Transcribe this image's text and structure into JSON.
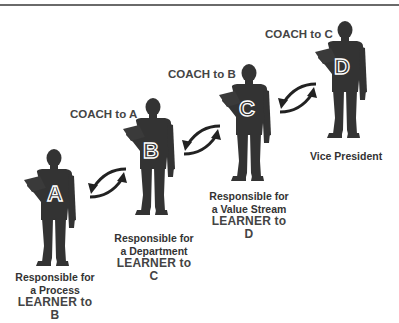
{
  "diagram": {
    "type": "coaching-chain",
    "colors": {
      "figure": "#333333",
      "text": "#3c3c3c",
      "background": "#ffffff",
      "rule": "#6a6a6a"
    },
    "figures": [
      {
        "letter": "A",
        "coach_label": "",
        "role_line1": "Responsible for",
        "role_line2": "a Process",
        "learner_label": "LEARNER to B"
      },
      {
        "letter": "B",
        "coach_label": "COACH to A",
        "role_line1": "Responsible for",
        "role_line2": "a Department",
        "learner_label": "LEARNER to C"
      },
      {
        "letter": "C",
        "coach_label": "COACH to B",
        "role_line1": "Responsible for",
        "role_line2": "a Value Stream",
        "learner_label": "LEARNER to D"
      },
      {
        "letter": "D",
        "coach_label": "COACH to C",
        "title": "Vice President"
      }
    ],
    "arrows": [
      {
        "between": "A-B",
        "icon": "bidirectional-curved-arrows-icon"
      },
      {
        "between": "B-C",
        "icon": "bidirectional-curved-arrows-icon"
      },
      {
        "between": "C-D",
        "icon": "bidirectional-curved-arrows-icon"
      }
    ]
  }
}
